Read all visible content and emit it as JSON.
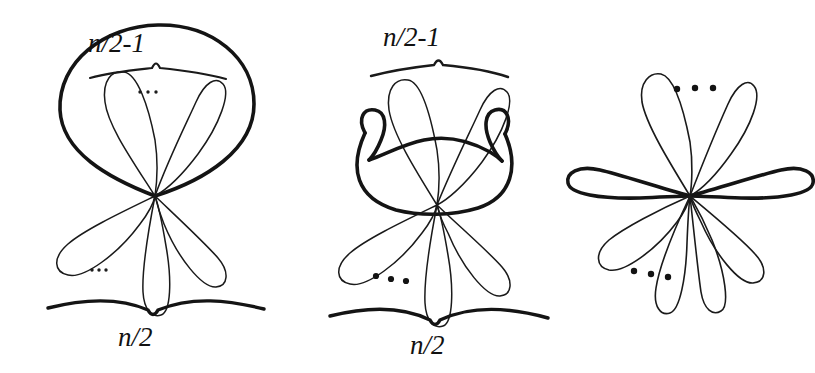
{
  "figure": {
    "background_color": "#ffffff",
    "ink_color": "#111111",
    "panels": [
      {
        "id": "left",
        "name": "rose-with-enclosing-oval",
        "top_label": "n/2-1",
        "bottom_label": "n/2",
        "top_brace": "upward-notch-brace",
        "bottom_brace": "downward-notch-brace",
        "enclosing_curve": "bold-oval",
        "upper_petals": 2,
        "lower_petals": 3,
        "upper_ellipsis": "...",
        "lower_ellipsis": "..."
      },
      {
        "id": "middle",
        "name": "rose-with-crossing-curled-arc",
        "top_label": "n/2-1",
        "bottom_label": "n/2",
        "top_brace": "upward-notch-brace",
        "bottom_brace": "downward-notch-brace",
        "enclosing_curve": "bold-curled-arc",
        "upper_petals": 2,
        "lower_petals": 3,
        "lower_ellipsis": "..."
      },
      {
        "id": "right",
        "name": "plain-eight-petal-rose",
        "top_label": "",
        "bottom_label": "",
        "bold_petals": "horizontal-pair",
        "upper_petals": 2,
        "lower_petals": 4,
        "upper_ellipsis": "...",
        "lower_ellipsis": "..."
      }
    ],
    "labels": {
      "n_half_minus_one": "n/2-1",
      "n_half": "n/2"
    }
  }
}
